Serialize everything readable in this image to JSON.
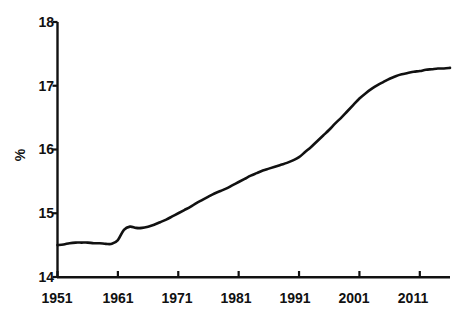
{
  "chart_data": {
    "type": "line",
    "title": "",
    "subtitle": "",
    "xlabel": "",
    "ylabel": "%",
    "xlim": [
      1951,
      2016
    ],
    "ylim": [
      14,
      18
    ],
    "grid": false,
    "legend": null,
    "y_ticks": [
      14,
      15,
      16,
      17,
      18
    ],
    "y_tick_labels": [
      "14",
      "15",
      "16",
      "17",
      "18"
    ],
    "x_ticks": [
      1951,
      1961,
      1971,
      1981,
      1991,
      2001,
      2011
    ],
    "x_tick_labels": [
      "1951",
      "1961",
      "1971",
      "1981",
      "1991",
      "2001",
      "2011"
    ],
    "line_color": "#111111",
    "line_width": 2.6,
    "series": [
      {
        "name": "",
        "x": [
          1951,
          1952,
          1953,
          1954,
          1955,
          1956,
          1957,
          1958,
          1959,
          1960,
          1961,
          1962,
          1963,
          1964,
          1965,
          1966,
          1967,
          1968,
          1969,
          1970,
          1971,
          1972,
          1973,
          1974,
          1975,
          1976,
          1977,
          1978,
          1979,
          1980,
          1981,
          1982,
          1983,
          1984,
          1985,
          1986,
          1987,
          1988,
          1989,
          1990,
          1991,
          1992,
          1993,
          1994,
          1995,
          1996,
          1997,
          1998,
          1999,
          2000,
          2001,
          2002,
          2003,
          2004,
          2005,
          2006,
          2007,
          2008,
          2009,
          2010,
          2011,
          2012,
          2013,
          2014,
          2015,
          2016
        ],
        "values": [
          14.5,
          14.51,
          14.53,
          14.54,
          14.54,
          14.54,
          14.53,
          14.53,
          14.52,
          14.52,
          14.58,
          14.74,
          14.79,
          14.77,
          14.77,
          14.79,
          14.82,
          14.86,
          14.9,
          14.95,
          15.0,
          15.05,
          15.1,
          15.16,
          15.21,
          15.26,
          15.31,
          15.35,
          15.39,
          15.44,
          15.49,
          15.54,
          15.59,
          15.63,
          15.67,
          15.7,
          15.73,
          15.76,
          15.79,
          15.83,
          15.88,
          15.96,
          16.04,
          16.13,
          16.22,
          16.31,
          16.41,
          16.5,
          16.6,
          16.7,
          16.8,
          16.88,
          16.95,
          17.01,
          17.06,
          17.11,
          17.15,
          17.18,
          17.2,
          17.22,
          17.23,
          17.25,
          17.26,
          17.27,
          17.27,
          17.28
        ]
      }
    ],
    "annotations": []
  }
}
